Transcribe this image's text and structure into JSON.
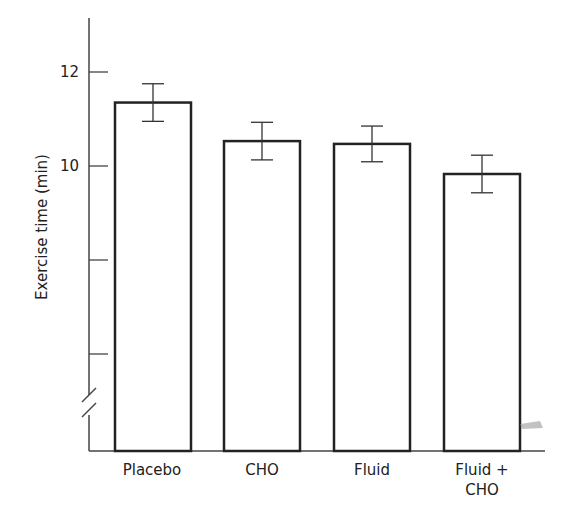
{
  "chart_data": {
    "type": "bar",
    "title": "",
    "xlabel": "",
    "ylabel": "Exercise time (min)",
    "categories": [
      "Placebo",
      "CHO",
      "Fluid",
      "Fluid + CHO"
    ],
    "category_lines": [
      [
        "Placebo"
      ],
      [
        "CHO"
      ],
      [
        "Fluid"
      ],
      [
        "Fluid +",
        "CHO"
      ]
    ],
    "values": [
      11.35,
      10.53,
      10.47,
      9.83
    ],
    "error": [
      0.4,
      0.4,
      0.38,
      0.4
    ],
    "yticks": [
      6,
      8,
      10,
      12
    ],
    "ytick_labels": [
      "",
      "",
      "10",
      "12"
    ],
    "ylim": [
      5.2,
      13.2
    ],
    "axis_break": true,
    "grid": false,
    "legend": null
  },
  "labels": {
    "ylabel": "Exercise time (min)",
    "tick12": "12",
    "tick10": "10",
    "cat0": "Placebo",
    "cat1": "CHO",
    "cat2": "Fluid",
    "cat3a": "Fluid +",
    "cat3b": "CHO"
  }
}
